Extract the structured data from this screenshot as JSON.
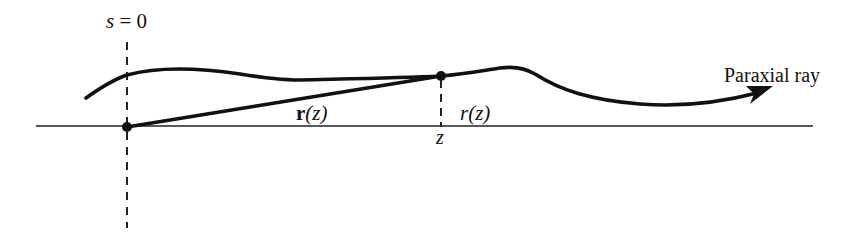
{
  "diagram": {
    "labels": {
      "origin_label": "s = 0",
      "origin_s": "s",
      "origin_eq": " = 0",
      "vector_label_bold": "r",
      "vector_label_arg": "(z)",
      "radial_label_r": "r",
      "radial_label_arg": "(z)",
      "z_tick_label": "z",
      "ray_label": "Paraxial ray"
    },
    "elements": [
      {
        "id": "optical-axis",
        "type": "horizontal line",
        "from": [
          36,
          126
        ],
        "to": [
          813,
          126
        ]
      },
      {
        "id": "origin-marker",
        "type": "dashed vertical line",
        "x": 127,
        "from_y": 42,
        "to_y": 228
      },
      {
        "id": "z-marker",
        "type": "dashed vertical line",
        "x": 441,
        "from_y": 76,
        "to_y": 127
      },
      {
        "id": "origin-point",
        "type": "dot",
        "at": [
          127,
          127
        ]
      },
      {
        "id": "ray-point",
        "type": "dot",
        "at": [
          441,
          76
        ]
      },
      {
        "id": "position-vector",
        "type": "line",
        "from": [
          127,
          127
        ],
        "to": [
          441,
          76
        ],
        "label": "r(z)"
      },
      {
        "id": "paraxial-ray",
        "type": "curve with arrowhead",
        "label": "Paraxial ray"
      }
    ],
    "colors": {
      "stroke": "#111111",
      "background": "#ffffff"
    }
  }
}
